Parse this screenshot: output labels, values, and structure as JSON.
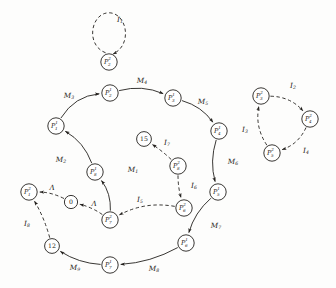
{
  "figure": {
    "kind": "state-transition-diagram",
    "width": 336,
    "height": 288,
    "background_color": "#fdfdfc",
    "ink_color": "#23201d"
  },
  "nodes": [
    {
      "id": "p2_2",
      "base": "P",
      "sup": "2",
      "sub": "2",
      "cx": 109,
      "cy": 62,
      "r": 8.2,
      "style": "circle"
    },
    {
      "id": "p2_1",
      "base": "P",
      "sup": "1",
      "sub": "2",
      "cx": 110,
      "cy": 93,
      "r": 8.2,
      "style": "circle"
    },
    {
      "id": "p3_1",
      "base": "P",
      "sup": "1",
      "sub": "3",
      "cx": 173,
      "cy": 98,
      "r": 8.2,
      "style": "circle"
    },
    {
      "id": "p1_1",
      "base": "P",
      "sup": "1",
      "sub": "1",
      "cx": 56,
      "cy": 126,
      "r": 8.2,
      "style": "circle"
    },
    {
      "id": "p4_1",
      "base": "P",
      "sup": "1",
      "sub": "4",
      "cx": 219,
      "cy": 131,
      "r": 8.2,
      "style": "circle"
    },
    {
      "id": "n15",
      "base": "15",
      "sup": "",
      "sub": "",
      "cx": 144,
      "cy": 139,
      "r": 7.4,
      "style": "number"
    },
    {
      "id": "p8_1",
      "base": "P",
      "sup": "1",
      "sub": "8",
      "cx": 95,
      "cy": 172,
      "r": 8.2,
      "style": "circle"
    },
    {
      "id": "p8_2",
      "base": "P",
      "sup": "2",
      "sub": "8",
      "cx": 178,
      "cy": 166,
      "r": 8.2,
      "style": "circle"
    },
    {
      "id": "p5_1",
      "base": "P",
      "sup": "1",
      "sub": "5",
      "cx": 218,
      "cy": 192,
      "r": 8.2,
      "style": "circle"
    },
    {
      "id": "p1_2",
      "base": "P",
      "sup": "2",
      "sub": "1",
      "cx": 29,
      "cy": 192,
      "r": 8.2,
      "style": "circle"
    },
    {
      "id": "n0",
      "base": "0",
      "sup": "",
      "sub": "",
      "cx": 71,
      "cy": 202,
      "r": 6.6,
      "style": "number"
    },
    {
      "id": "p6_2",
      "base": "P",
      "sup": "2",
      "sub": "6",
      "cx": 184,
      "cy": 208,
      "r": 8.2,
      "style": "circle"
    },
    {
      "id": "p7_2",
      "base": "P",
      "sup": "2",
      "sub": "7",
      "cx": 110,
      "cy": 220,
      "r": 8.2,
      "style": "circle"
    },
    {
      "id": "n12",
      "base": "12",
      "sup": "",
      "sub": "",
      "cx": 52,
      "cy": 246,
      "r": 7.4,
      "style": "number"
    },
    {
      "id": "p6_1",
      "base": "P",
      "sup": "1",
      "sub": "6",
      "cx": 186,
      "cy": 243,
      "r": 8.2,
      "style": "circle"
    },
    {
      "id": "p7_1",
      "base": "P",
      "sup": "1",
      "sub": "7",
      "cx": 110,
      "cy": 265,
      "r": 8.2,
      "style": "circle"
    },
    {
      "id": "p3_2",
      "base": "P",
      "sup": "2",
      "sub": "3",
      "cx": 261,
      "cy": 96,
      "r": 8.2,
      "style": "circle"
    },
    {
      "id": "p4_2",
      "base": "P",
      "sup": "2",
      "sub": "4",
      "cx": 310,
      "cy": 119,
      "r": 8.2,
      "style": "circle"
    },
    {
      "id": "p5_2",
      "base": "P",
      "sup": "2",
      "sub": "5",
      "cx": 272,
      "cy": 153,
      "r": 8.2,
      "style": "circle"
    }
  ],
  "edges": [
    {
      "id": "e_I1",
      "from": "p2_2",
      "to": "p2_2",
      "label_base": "I",
      "label_sub": "1",
      "lx": 120,
      "ly": 20,
      "dashed": true,
      "kind": "self-loop"
    },
    {
      "id": "e_M3",
      "from": "p1_1",
      "to": "p2_1",
      "label_base": "M",
      "label_sub": "3",
      "lx": 69,
      "ly": 96,
      "dashed": false,
      "kind": "arc"
    },
    {
      "id": "e_M4",
      "from": "p2_1",
      "to": "p3_1",
      "label_base": "M",
      "label_sub": "4",
      "lx": 142,
      "ly": 81,
      "dashed": false,
      "kind": "arc"
    },
    {
      "id": "e_M5",
      "from": "p3_1",
      "to": "p4_1",
      "label_base": "M",
      "label_sub": "5",
      "lx": 203,
      "ly": 102,
      "dashed": false,
      "kind": "arc"
    },
    {
      "id": "e_M6",
      "from": "p4_1",
      "to": "p5_1",
      "label_base": "M",
      "label_sub": "6",
      "lx": 233,
      "ly": 162,
      "dashed": false,
      "kind": "arc"
    },
    {
      "id": "e_M7",
      "from": "p5_1",
      "to": "p6_1",
      "label_base": "M",
      "label_sub": "7",
      "lx": 216,
      "ly": 226,
      "dashed": false,
      "kind": "arc"
    },
    {
      "id": "e_M8",
      "from": "p6_1",
      "to": "p7_1",
      "label_base": "M",
      "label_sub": "8",
      "lx": 154,
      "ly": 269,
      "dashed": false,
      "kind": "arc"
    },
    {
      "id": "e_M9",
      "from": "p7_1",
      "to": "n12",
      "label_base": "M",
      "label_sub": "9",
      "lx": 75,
      "ly": 268,
      "dashed": false,
      "kind": "arc"
    },
    {
      "id": "e_M1",
      "from": "p7_2",
      "to": "p8_1",
      "label_base": "M",
      "label_sub": "1",
      "lx": 133,
      "ly": 170,
      "dashed": false,
      "kind": "arc"
    },
    {
      "id": "e_M2",
      "from": "p8_1",
      "to": "p1_1",
      "label_base": "M",
      "label_sub": "2",
      "lx": 61,
      "ly": 160,
      "dashed": false,
      "kind": "arc"
    },
    {
      "id": "e_I7",
      "from": "p8_2",
      "to": "n15",
      "label_base": "I",
      "label_sub": "7",
      "lx": 167,
      "ly": 143,
      "dashed": true,
      "kind": "arc"
    },
    {
      "id": "e_I6",
      "from": "p8_2",
      "to": "p6_2",
      "label_base": "I",
      "label_sub": "6",
      "lx": 194,
      "ly": 186,
      "dashed": true,
      "kind": "arc"
    },
    {
      "id": "e_I5",
      "from": "p6_2",
      "to": "p7_2",
      "label_base": "I",
      "label_sub": "5",
      "lx": 140,
      "ly": 200,
      "dashed": true,
      "kind": "arc"
    },
    {
      "id": "e_L2",
      "from": "p7_2",
      "to": "n0",
      "label_base": "Λ",
      "label_sub": "",
      "lx": 94,
      "ly": 204,
      "dashed": true,
      "kind": "arc"
    },
    {
      "id": "e_L1",
      "from": "n0",
      "to": "p1_2",
      "label_base": "Λ",
      "label_sub": "",
      "lx": 52,
      "ly": 188,
      "dashed": true,
      "kind": "arc"
    },
    {
      "id": "e_I8",
      "from": "n12",
      "to": "p1_2",
      "label_base": "I",
      "label_sub": "8",
      "lx": 27,
      "ly": 224,
      "dashed": true,
      "kind": "arc"
    },
    {
      "id": "e_I2",
      "from": "p3_2",
      "to": "p4_2",
      "label_base": "I",
      "label_sub": "2",
      "lx": 293,
      "ly": 86,
      "dashed": true,
      "kind": "arc"
    },
    {
      "id": "e_I4",
      "from": "p4_2",
      "to": "p5_2",
      "label_base": "I",
      "label_sub": "4",
      "lx": 306,
      "ly": 151,
      "dashed": true,
      "kind": "arc"
    },
    {
      "id": "e_I3",
      "from": "p5_2",
      "to": "p3_2",
      "label_base": "I",
      "label_sub": "3",
      "lx": 245,
      "ly": 130,
      "dashed": true,
      "kind": "arc"
    }
  ]
}
